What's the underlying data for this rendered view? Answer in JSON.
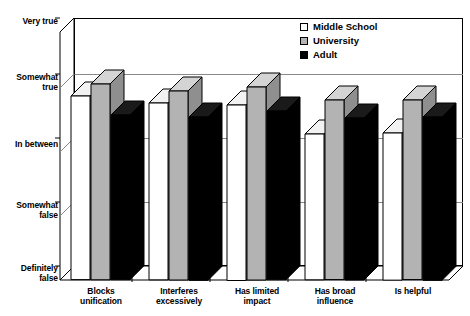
{
  "chart_data": {
    "type": "bar",
    "title": "",
    "subtitle": "",
    "xlabel": "",
    "ylabel": "",
    "grid": true,
    "legend_position": "top-right",
    "categories": [
      "Blocks unification",
      "Interferes excessively",
      "Has limited impact",
      "Has broad influence",
      "Is helpful"
    ],
    "category_lines": [
      [
        "Blocks",
        "unification"
      ],
      [
        "Interferes",
        "excessively"
      ],
      [
        "Has limited",
        "impact"
      ],
      [
        "Has broad",
        "influence"
      ],
      [
        "Is helpful",
        ""
      ]
    ],
    "ytick_labels": [
      "Very true",
      "Somewhat true",
      "In between",
      "Somewhat false",
      "Definitely false"
    ],
    "ytick_lines": [
      [
        "Very true",
        ""
      ],
      [
        "Somewhat",
        "true"
      ],
      [
        "In between",
        ""
      ],
      [
        "Somewhat",
        "false"
      ],
      [
        "Definitely",
        "false"
      ]
    ],
    "ytick_values": [
      5,
      4,
      3,
      2,
      1
    ],
    "ylim": [
      1,
      5
    ],
    "series": [
      {
        "name": "Middle School",
        "color": "#ffffff",
        "top_color": "#f2f2f2",
        "side_color": "#d9d9d9",
        "values": [
          3.72,
          3.62,
          3.6,
          3.16,
          3.18
        ]
      },
      {
        "name": "University",
        "color": "#b3b3b3",
        "top_color": "#d4d4d4",
        "side_color": "#8f8f8f",
        "values": [
          3.9,
          3.8,
          3.86,
          3.66,
          3.66
        ]
      },
      {
        "name": "Adult",
        "color": "#000000",
        "top_color": "#1a1a1a",
        "side_color": "#000000",
        "values": [
          3.44,
          3.42,
          3.5,
          3.4,
          3.42
        ]
      }
    ]
  },
  "legend": {
    "items": [
      {
        "label": "Middle School",
        "color": "#ffffff"
      },
      {
        "label": "University",
        "color": "#b3b3b3"
      },
      {
        "label": "Adult",
        "color": "#000000"
      }
    ]
  }
}
